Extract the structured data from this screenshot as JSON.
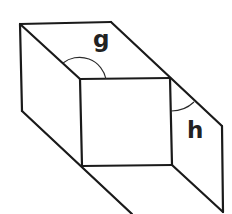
{
  "diagram": {
    "type": "3d-box-net-perspective",
    "labels": {
      "angle_top": "g",
      "angle_right": "h"
    },
    "colors": {
      "stroke": "#1a1a1a",
      "background": "#ffffff"
    },
    "vertices": {
      "outer_top_left": [
        20,
        24
      ],
      "outer_top_right": [
        111,
        22
      ],
      "inner_top_left": [
        80,
        79
      ],
      "inner_top_right": [
        170,
        78
      ],
      "inner_bottom_left": [
        82,
        166
      ],
      "inner_bottom_right": [
        172,
        165
      ],
      "outer_left_bottom": [
        22,
        111
      ],
      "outer_right_top": [
        222,
        126
      ],
      "outer_right_bottom": [
        223,
        212
      ],
      "outer_bottom_left": [
        132,
        214
      ]
    }
  }
}
